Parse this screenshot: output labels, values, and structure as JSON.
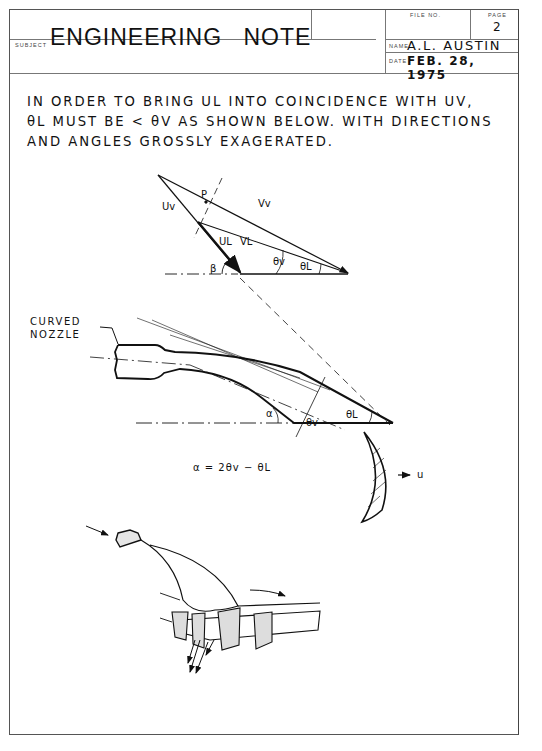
{
  "header": {
    "title": "ENGINEERING NOTE",
    "subject_label": "SUBJECT",
    "subject_value": "",
    "file_no_label": "FILE NO.",
    "file_no_value": "",
    "page_label": "PAGE",
    "page_value": "2",
    "name_label": "NAME",
    "name_value": "A.L. AUSTIN",
    "date_label": "DATE",
    "date_value": "FEB. 28, 1975"
  },
  "body": {
    "note_lines": [
      "IN ORDER TO BRING UL INTO COINCIDENCE WITH UV,",
      "θL MUST BE < θV AS SHOWN BELOW. WITH DIRECTIONS",
      "AND ANGLES GROSSLY EXAGERATED."
    ]
  },
  "figure1": {
    "labels": {
      "p": "P",
      "uv": "Uv",
      "vv": "Vv",
      "ul": "UL",
      "vl": "VL",
      "beta": "β",
      "theta_v": "θv",
      "theta_l": "θL"
    }
  },
  "figure2": {
    "callout_line1": "CURVED",
    "callout_line2": "NOZZLE",
    "labels": {
      "alpha": "α",
      "theta_v": "θv",
      "theta_l": "θL",
      "u": "u"
    },
    "equation": "α = 2θv − θL"
  },
  "figure3": {
    "description": "Perspective sketch of curved nozzle feeding rotor blades"
  }
}
